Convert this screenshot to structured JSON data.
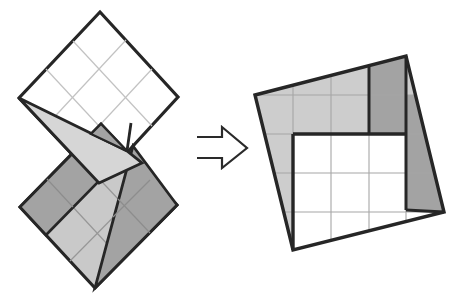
{
  "canvas": {
    "width": 460,
    "height": 300,
    "background": "#ffffff"
  },
  "palette": {
    "outline": "#262626",
    "light_gray": "#cdcdcd",
    "mid_gray": "#c9c9c9",
    "strip_gray": "#d6d6d6",
    "dark_gray": "#a3a3a3",
    "thin_grid_white": "#c2c2c2",
    "thin_grid_gray": "#979797",
    "thin_grid_result": "#a6a6a6"
  },
  "figures": [
    {
      "name": "folded-state-figure",
      "shapes": [
        {
          "name": "top-square",
          "type": "polygon",
          "pts": [
            [
              100,
              12
            ],
            [
              178,
              97
            ],
            [
              99,
              183
            ],
            [
              19,
              98
            ]
          ],
          "fill": "#ffffff",
          "stroke": "#262626",
          "sw": 3.2
        },
        {
          "name": "top-square-gridline-1",
          "type": "line",
          "pts": [
            [
              73,
              41
            ],
            [
              152,
              126
            ]
          ],
          "stroke": "#c2c2c2",
          "sw": 1.2
        },
        {
          "name": "top-square-gridline-2",
          "type": "line",
          "pts": [
            [
              46,
              69
            ],
            [
              125,
              154
            ]
          ],
          "stroke": "#c2c2c2",
          "sw": 1.2
        },
        {
          "name": "top-square-gridline-3",
          "type": "line",
          "pts": [
            [
              126,
              40
            ],
            [
              46,
              126
            ]
          ],
          "stroke": "#c2c2c2",
          "sw": 1.2
        },
        {
          "name": "top-square-gridline-4",
          "type": "line",
          "pts": [
            [
              152,
              69
            ],
            [
              72,
              155
            ]
          ],
          "stroke": "#c2c2c2",
          "sw": 1.2
        },
        {
          "name": "slit-crease",
          "type": "line",
          "pts": [
            [
              131,
              123
            ],
            [
              127,
              151
            ]
          ],
          "stroke": "#262626",
          "sw": 2.8
        },
        {
          "name": "bottom-square",
          "type": "polygon",
          "pts": [
            [
              101,
              124
            ],
            [
              177,
              205
            ],
            [
              95,
              288
            ],
            [
              20,
              207
            ]
          ],
          "fill": "#c9c9c9",
          "stroke": "#262626",
          "sw": 3.2
        },
        {
          "name": "bottom-square-gridline-1",
          "type": "line",
          "pts": [
            [
              74,
              152
            ],
            [
              150,
              233
            ]
          ],
          "stroke": "#979797",
          "sw": 1.2
        },
        {
          "name": "bottom-square-gridline-2",
          "type": "line",
          "pts": [
            [
              47,
              179
            ],
            [
              122,
              260
            ]
          ],
          "stroke": "#979797",
          "sw": 1.2
        },
        {
          "name": "bottom-square-gridline-3",
          "type": "line",
          "pts": [
            [
              126,
              151
            ],
            [
              45,
              234
            ]
          ],
          "stroke": "#979797",
          "sw": 1.2
        },
        {
          "name": "bottom-square-gridline-4",
          "type": "line",
          "pts": [
            [
              152,
              178
            ],
            [
              70,
              261
            ]
          ],
          "stroke": "#979797",
          "sw": 1.2
        },
        {
          "name": "dark-parallelogram-flap",
          "type": "polygon",
          "pts": [
            [
              20,
              207
            ],
            [
              74,
              152
            ],
            [
              100,
              180
            ],
            [
              46,
              235
            ]
          ],
          "fill": "#a3a3a3",
          "stroke": "#262626",
          "sw": 2.6
        },
        {
          "name": "dark-parallelogram-gridline",
          "type": "line",
          "pts": [
            [
              47,
              179
            ],
            [
              73,
              207
            ]
          ],
          "stroke": "#8d8d8d",
          "sw": 1.2
        },
        {
          "name": "dark-triangle-flap",
          "type": "polygon",
          "pts": [
            [
              133,
              146
            ],
            [
              177,
              205
            ],
            [
              95,
              288
            ]
          ],
          "fill": "#a3a3a3",
          "stroke": "#262626",
          "sw": 2.8
        },
        {
          "name": "dark-triangle-gridline-1",
          "type": "line",
          "pts": [
            [
              118,
              199
            ],
            [
              150,
              233
            ]
          ],
          "stroke": "#8d8d8d",
          "sw": 1.2
        },
        {
          "name": "dark-triangle-gridline-2",
          "type": "line",
          "pts": [
            [
              150,
              180
            ],
            [
              113,
              217
            ]
          ],
          "stroke": "#8d8d8d",
          "sw": 1.2
        },
        {
          "name": "fold-strip",
          "type": "polygon",
          "pts": [
            [
              19,
              98
            ],
            [
              127,
              151
            ],
            [
              142,
              163
            ],
            [
              99,
              183
            ]
          ],
          "fill": "#d6d6d6",
          "stroke": "#262626",
          "sw": 2.8
        },
        {
          "name": "fold-beak",
          "type": "polygon",
          "pts": [
            [
              101,
              124
            ],
            [
              91,
              134
            ],
            [
              127,
              151
            ]
          ],
          "fill": "#a3a3a3",
          "stroke": "#262626",
          "sw": 2.2
        }
      ]
    },
    {
      "name": "transform-arrow",
      "shapes": [
        {
          "name": "right-arrow-icon",
          "type": "polyline",
          "pts": [
            [
              197,
              137
            ],
            [
              222,
              137
            ],
            [
              222,
              127
            ],
            [
              247,
              148
            ],
            [
              222,
              168
            ],
            [
              222,
              158
            ],
            [
              197,
              158
            ]
          ],
          "fill": "none",
          "stroke": "#2a2a2a",
          "sw": 2.2
        }
      ]
    },
    {
      "name": "unfolded-square-figure",
      "shapes": [
        {
          "name": "result-square-fill",
          "type": "polygon",
          "pts": [
            [
              255,
              95
            ],
            [
              406,
              56
            ],
            [
              444,
              212
            ],
            [
              293,
              250
            ]
          ],
          "fill": "#ffffff",
          "stroke": "none",
          "sw": 0
        },
        {
          "name": "result-light-band",
          "type": "polygon",
          "pts": [
            [
              255,
              95
            ],
            [
              369,
              66
            ],
            [
              369,
              134
            ],
            [
              293,
              134
            ],
            [
              293,
              250
            ]
          ],
          "fill": "#cdcdcd",
          "stroke": "none",
          "sw": 0
        },
        {
          "name": "result-dark-rect",
          "type": "polygon",
          "pts": [
            [
              369,
              66
            ],
            [
              406,
              56
            ],
            [
              406,
              134
            ],
            [
              369,
              134
            ]
          ],
          "fill": "#a3a3a3",
          "stroke": "none",
          "sw": 0
        },
        {
          "name": "result-corner-sliver",
          "type": "polygon",
          "pts": [
            [
              406,
              56
            ],
            [
              416,
              95
            ],
            [
              406,
              95
            ]
          ],
          "fill": "#cdcdcd",
          "stroke": "none",
          "sw": 0
        },
        {
          "name": "result-dark-quad",
          "type": "polygon",
          "pts": [
            [
              406,
              95
            ],
            [
              416,
              95
            ],
            [
              444,
              212
            ],
            [
              406,
              210
            ]
          ],
          "fill": "#a3a3a3",
          "stroke": "none",
          "sw": 0
        },
        {
          "name": "result-gridline-v1",
          "type": "line",
          "pts": [
            [
              293,
              85
            ],
            [
              293,
              250
            ]
          ],
          "stroke": "#a6a6a6",
          "sw": 1.1
        },
        {
          "name": "result-gridline-v2",
          "type": "line",
          "pts": [
            [
              331,
              75
            ],
            [
              331,
              240
            ]
          ],
          "stroke": "#a6a6a6",
          "sw": 1.1
        },
        {
          "name": "result-gridline-v3",
          "type": "line",
          "pts": [
            [
              369,
              66
            ],
            [
              369,
              231
            ]
          ],
          "stroke": "#a6a6a6",
          "sw": 1.1
        },
        {
          "name": "result-gridline-v4",
          "type": "line",
          "pts": [
            [
              406,
              56
            ],
            [
              406,
              222
            ]
          ],
          "stroke": "#a6a6a6",
          "sw": 1.1
        },
        {
          "name": "result-gridline-h1",
          "type": "line",
          "pts": [
            [
              255,
              95
            ],
            [
              416,
              95
            ]
          ],
          "stroke": "#a6a6a6",
          "sw": 1.1
        },
        {
          "name": "result-gridline-h2",
          "type": "line",
          "pts": [
            [
              265,
              134
            ],
            [
              425,
              134
            ]
          ],
          "stroke": "#a6a6a6",
          "sw": 1.1
        },
        {
          "name": "result-gridline-h3",
          "type": "line",
          "pts": [
            [
              274,
              173
            ],
            [
              434,
              173
            ]
          ],
          "stroke": "#a6a6a6",
          "sw": 1.1
        },
        {
          "name": "result-gridline-h4",
          "type": "line",
          "pts": [
            [
              284,
              212
            ],
            [
              444,
              212
            ]
          ],
          "stroke": "#a6a6a6",
          "sw": 1.1
        },
        {
          "name": "result-thick-divider-v1",
          "type": "line",
          "pts": [
            [
              369,
              66
            ],
            [
              369,
              134
            ]
          ],
          "stroke": "#262626",
          "sw": 3.0
        },
        {
          "name": "inner-square-top-edge",
          "type": "line",
          "pts": [
            [
              293,
              134
            ],
            [
              406,
              134
            ]
          ],
          "stroke": "#262626",
          "sw": 3.4
        },
        {
          "name": "inner-square-left-edge",
          "type": "line",
          "pts": [
            [
              293,
              134
            ],
            [
              293,
              250
            ]
          ],
          "stroke": "#262626",
          "sw": 3.4
        },
        {
          "name": "result-thick-divider-v2",
          "type": "line",
          "pts": [
            [
              406,
              56
            ],
            [
              406,
              210
            ]
          ],
          "stroke": "#262626",
          "sw": 3.0
        },
        {
          "name": "result-dark-quad-bottom-edge",
          "type": "line",
          "pts": [
            [
              406,
              210
            ],
            [
              444,
              212
            ]
          ],
          "stroke": "#262626",
          "sw": 3.0
        },
        {
          "name": "result-square-outline",
          "type": "polygon",
          "pts": [
            [
              255,
              95
            ],
            [
              406,
              56
            ],
            [
              444,
              212
            ],
            [
              293,
              250
            ]
          ],
          "fill": "none",
          "stroke": "#262626",
          "sw": 3.4
        }
      ]
    }
  ]
}
